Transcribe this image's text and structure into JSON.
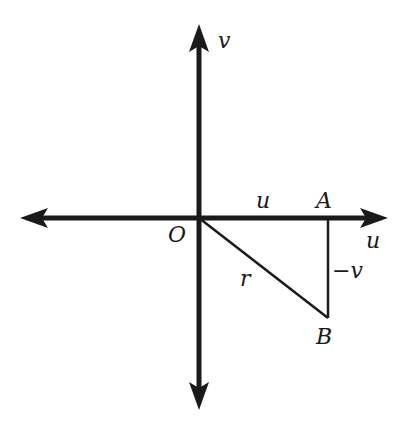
{
  "diagram": {
    "type": "coordinate-plane-right-triangle",
    "axes": {
      "horizontal_label": "u",
      "vertical_label": "v",
      "origin_label": "O"
    },
    "points": {
      "origin": "O",
      "a": "A",
      "b": "B"
    },
    "segments": {
      "oa_label": "u",
      "ab_label": "−v",
      "ob_label": "r"
    },
    "colors": {
      "ink": "#1a1a1a",
      "background": "#ffffff"
    }
  }
}
